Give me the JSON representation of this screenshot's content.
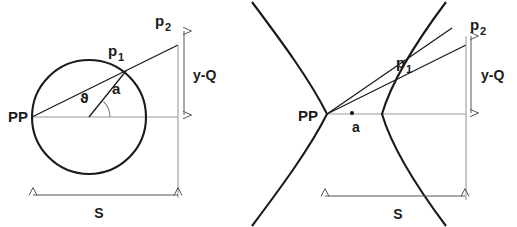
{
  "figure": {
    "background_color": "#ffffff",
    "curve_color": "#1a1a1a",
    "axis_color": "#999999",
    "dim_color": "#555555",
    "text_color": "#1a1a1a"
  },
  "left_panel": {
    "name": "circle-diagram",
    "shape": "circle",
    "labels": {
      "origin": "PP",
      "point_on_curve_base": "p",
      "point_on_curve_sub": "1",
      "point_projected_base": "p",
      "point_projected_sub": "2",
      "radius": "a",
      "angle": "ϑ",
      "vertical_dimension": "y-Q",
      "horizontal_dimension": "S"
    },
    "geometry": {
      "circle_center_x": 89,
      "circle_center_y": 117,
      "circle_radius": 57,
      "pp_x": 32,
      "pp_y": 117,
      "p1_x": 126,
      "p1_y": 71,
      "p2_x": 178,
      "p2_y": 45,
      "ref_line_x": 178,
      "dim_arrow_x": 184,
      "dim_top_y": 31,
      "dim_bottom_y": 115,
      "s_arrow_y": 195,
      "s_left_x": 33,
      "s_right_x": 178
    }
  },
  "right_panel": {
    "name": "hyperbola-diagram",
    "shape": "hyperbola",
    "labels": {
      "origin": "PP",
      "point_on_curve_base": "p",
      "point_on_curve_sub": "1",
      "point_projected_base": "p",
      "point_projected_sub": "2",
      "focus_marker": "a",
      "vertical_dimension": "y-Q",
      "horizontal_dimension": "S"
    },
    "geometry": {
      "pp_x": 327,
      "pp_y": 114,
      "focus_dot_x": 352,
      "focus_dot_y": 113,
      "right_vertex_x": 382,
      "p1_x": 417,
      "p1_y": 78,
      "p2_x": 466,
      "p2_y": 45,
      "ref_line_x": 466,
      "dim_arrow_x": 471,
      "dim_top_y": 36,
      "dim_bottom_y": 113,
      "s_arrow_y": 196,
      "s_left_x": 325,
      "s_right_x": 465
    }
  }
}
